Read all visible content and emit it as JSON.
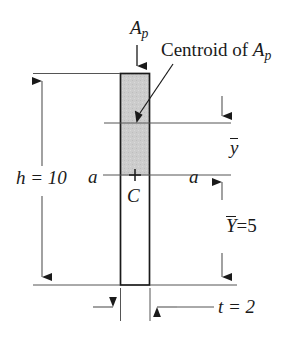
{
  "figure": {
    "kind": "engineering-cross-section-diagram",
    "background_color": "#ffffff",
    "line_color": "#1a1a1a",
    "shade_color": "#cccccc"
  },
  "labels": {
    "ap": "A",
    "ap_sub": "p",
    "centroid_of": "Centroid of ",
    "centroid_ap": "A",
    "centroid_ap_sub": "p",
    "height": "h = 10",
    "section_left": "a",
    "section_right": "a",
    "centroid_marker": "C",
    "ybar": "y",
    "Ybar": "Y",
    "Ybar_value": "=5",
    "thickness": "t = 2"
  },
  "values": {
    "h": 10,
    "t": 2,
    "Y_bar": 5
  },
  "geometry": {
    "bar_left": 120,
    "bar_right": 150,
    "bar_top": 73,
    "bar_bottom": 285,
    "shade_top": 73,
    "shade_bottom": 175,
    "ap_centroid_line_y": 123,
    "section_line_y": 175,
    "left_dim_x": 42,
    "right_dim_x": 222,
    "thickness_dim_y": 307
  }
}
